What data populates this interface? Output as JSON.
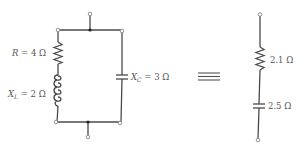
{
  "diagram": {
    "type": "circuit-equivalence",
    "left_circuit": {
      "topology": "parallel",
      "branch_1": {
        "resistor": {
          "symbol": "R",
          "value": "4",
          "unit": "Ω",
          "label": "R = 4 Ω"
        },
        "inductor": {
          "symbol": "X",
          "subscript": "L",
          "value": "2",
          "unit": "Ω",
          "label": "X_L = 2 Ω"
        }
      },
      "branch_2": {
        "capacitor": {
          "symbol": "X",
          "subscript": "C",
          "value": "3",
          "unit": "Ω",
          "label": "X_C = 3 Ω"
        }
      }
    },
    "equivalence_symbol": "≡",
    "right_circuit": {
      "topology": "series",
      "resistor": {
        "label": "2.1 Ω"
      },
      "capacitor": {
        "label": "2.5 Ω"
      }
    },
    "colors": {
      "wire": "#4a4a4a",
      "text": "#555555",
      "terminal": "#888888"
    }
  },
  "labels": {
    "r_symbol": "R",
    "r_eq": " = 4 Ω",
    "xl_symbol": "X",
    "xl_sub": "L",
    "xl_eq": " = 2 Ω",
    "xc_symbol": "X",
    "xc_sub": "C",
    "xc_eq": " = 3 Ω",
    "equiv": "≡",
    "req": "2.1 Ω",
    "xceq": "2.5 Ω"
  }
}
